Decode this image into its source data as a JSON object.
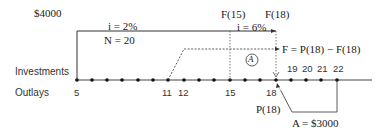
{
  "labels": {
    "initial_amount": "$4000",
    "rate1": "i = 2%",
    "periods": "N = 20",
    "f15": "F(15)",
    "f18": "F(18)",
    "rate2": "i = 6%",
    "marker": "A",
    "equation": "F = P(18) − F(18)",
    "investments": "Investments",
    "outlays": "Outlays",
    "p18": "P(18)",
    "annuity": "A = $3000"
  },
  "ticks_below": [
    "5",
    "11",
    "12",
    "15",
    "18"
  ],
  "ticks_above": [
    "19",
    "20",
    "21",
    "22"
  ],
  "timeline": {
    "start_period": 5,
    "end_period": 22
  }
}
